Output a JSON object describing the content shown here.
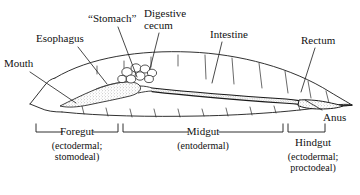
{
  "figure": {
    "background": "#ffffff",
    "ink": "#1a1a1a",
    "stipple": "#8d8d8d"
  },
  "callouts": [
    {
      "id": "mouth",
      "label": "Mouth",
      "x": 4,
      "y": 58,
      "leader": [
        30,
        72,
        76,
        103
      ]
    },
    {
      "id": "esophagus",
      "label": "Esophagus",
      "x": 36,
      "y": 33,
      "leader": [
        78,
        47,
        107,
        84
      ]
    },
    {
      "id": "stomach",
      "label": "“Stomach”",
      "x": 88,
      "y": 13,
      "leader": [
        118,
        27,
        137,
        77
      ]
    },
    {
      "id": "cecum",
      "label": "Digestive\ncecum",
      "x": 144,
      "y": 8,
      "leader": [
        159,
        33,
        150,
        69
      ]
    },
    {
      "id": "intestine",
      "label": "Intestine",
      "x": 210,
      "y": 29,
      "leader": [
        222,
        42,
        212,
        83
      ]
    },
    {
      "id": "rectum",
      "label": "Rectum",
      "x": 301,
      "y": 35,
      "leader": [
        315,
        48,
        301,
        92
      ]
    },
    {
      "id": "anus",
      "label": "Anus",
      "x": 323,
      "y": 112,
      "leader": [
        322,
        112,
        305,
        99
      ]
    }
  ],
  "regions": [
    {
      "id": "foregut",
      "label": "Foregut",
      "sub": "(ectodermal;\nstomodeal)",
      "bracket": {
        "x1": 36,
        "x2": 118,
        "y": 132,
        "tick": 8
      },
      "label_x": 77,
      "label_y": 127,
      "sub_x": 77,
      "sub_y": 142
    },
    {
      "id": "midgut",
      "label": "Midgut",
      "sub": "(entodermal)",
      "bracket": {
        "x1": 123,
        "x2": 283,
        "y": 132,
        "tick": 8
      },
      "label_x": 203,
      "label_y": 127,
      "sub_x": 203,
      "sub_y": 142
    },
    {
      "id": "hindgut",
      "label": "Hindgut",
      "sub": "(ectodermal;\nproctodeal)",
      "bracket": {
        "x1": 288,
        "x2": 325,
        "y": 132,
        "tick": 8
      },
      "label_x": 312,
      "label_y": 138,
      "sub_x": 312,
      "sub_y": 153
    }
  ]
}
